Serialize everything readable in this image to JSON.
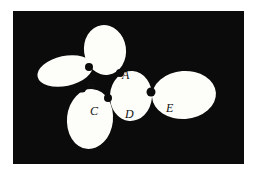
{
  "figure": {
    "kind": "tangent-disk-chain-diagram",
    "background_color": "#0b0b0b",
    "page_color": "#ffffff",
    "disk_color": "#fdfdfa",
    "junction_color": "#0b0b0b",
    "label_color": "#111111",
    "frame": {
      "x": 13,
      "y": 11,
      "width": 231,
      "height": 153
    },
    "disks": [
      {
        "id": "disk-top",
        "name": "top-disk",
        "cx": 92,
        "cy": 39,
        "rx": 21,
        "ry": 25,
        "rotation": -8
      },
      {
        "id": "disk-left",
        "name": "left-disk",
        "cx": 52,
        "cy": 60,
        "rx": 28,
        "ry": 15,
        "rotation": -12
      },
      {
        "id": "disk-bottom",
        "name": "bottom-disk",
        "cx": 77,
        "cy": 108,
        "rx": 23,
        "ry": 30,
        "rotation": 6
      },
      {
        "id": "disk-middle",
        "name": "middle-disk",
        "cx": 118,
        "cy": 85,
        "rx": 21,
        "ry": 25,
        "rotation": 4
      },
      {
        "id": "disk-right",
        "name": "right-disk",
        "cx": 171,
        "cy": 84,
        "rx": 32,
        "ry": 24,
        "rotation": -4
      }
    ],
    "junctions": [
      {
        "id": "junction-a",
        "name": "junction-point-a",
        "cx": 107,
        "cy": 62,
        "r": 4
      },
      {
        "id": "junction-b",
        "name": "junction-point-b",
        "cx": 76,
        "cy": 56,
        "r": 4
      },
      {
        "id": "junction-c",
        "name": "junction-point-c",
        "cx": 69,
        "cy": 77,
        "r": 4.5
      },
      {
        "id": "junction-d",
        "name": "junction-point-d",
        "cx": 95,
        "cy": 87,
        "r": 4
      },
      {
        "id": "junction-e",
        "name": "junction-point-e",
        "cx": 138,
        "cy": 81,
        "r": 4.5
      }
    ],
    "labels": [
      {
        "id": "label-a",
        "text": "A",
        "x": 109,
        "y": 58
      },
      {
        "id": "label-b",
        "text": "B",
        "x": 74,
        "y": 68
      },
      {
        "id": "label-c",
        "text": "C",
        "x": 77,
        "y": 94
      },
      {
        "id": "label-d",
        "text": "D",
        "x": 112,
        "y": 97
      },
      {
        "id": "label-e",
        "text": "E",
        "x": 153,
        "y": 91
      }
    ]
  }
}
